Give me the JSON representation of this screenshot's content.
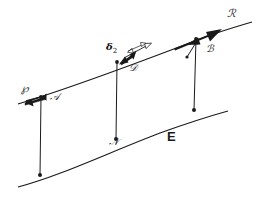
{
  "figure": {
    "background_color": "#ffffff",
    "stroke_color": "#1a1a1a",
    "width": 275,
    "height": 204
  },
  "labels": {
    "p_point": "℘",
    "a_vector": "𝒜",
    "delta": "δ",
    "delta_sub": "2",
    "d_point": "𝒟",
    "b_vector": "ℬ",
    "r_point": "ℛ",
    "n_point": "𝒩",
    "region": "E"
  },
  "label_positions": {
    "p_point": {
      "x": 21,
      "y": 89
    },
    "a_vector": {
      "x": 50,
      "y": 98
    },
    "delta": {
      "x": 107,
      "y": 47
    },
    "d_point": {
      "x": 130,
      "y": 68
    },
    "b_vector": {
      "x": 207,
      "y": 48
    },
    "r_point": {
      "x": 228,
      "y": 13
    },
    "n_point": {
      "x": 110,
      "y": 142
    },
    "region": {
      "x": 168,
      "y": 137
    }
  },
  "geometry": {
    "upper_curve": {
      "name": "upper-curve",
      "path": "M 18 104 C 70 88 140 62 200 39 C 215 33 235 27 252 22",
      "description": "Upper curve rising left to right with arrowhead near R"
    },
    "lower_curve": {
      "name": "lower-curve",
      "path": "M 18 187 C 60 176 110 152 160 133 C 185 124 210 116 228 111",
      "description": "Lower curve rising left to right"
    },
    "transversals": [
      {
        "name": "transversal-p",
        "x1": 41,
        "y1": 97,
        "x2": 40,
        "y2": 175
      },
      {
        "name": "transversal-d",
        "x1": 117,
        "y1": 62,
        "x2": 116,
        "y2": 139
      },
      {
        "name": "transversal-b",
        "x1": 196,
        "y1": 39,
        "x2": 194,
        "y2": 110
      }
    ],
    "nodes": [
      {
        "name": "node-p-upper",
        "x": 41,
        "y": 97
      },
      {
        "name": "node-p-lower",
        "x": 40,
        "y": 175
      },
      {
        "name": "node-d-upper",
        "x": 117,
        "y": 62
      },
      {
        "name": "node-n-lower",
        "x": 116,
        "y": 139
      },
      {
        "name": "node-b-upper",
        "x": 196,
        "y": 39
      },
      {
        "name": "node-b-lower",
        "x": 194,
        "y": 110
      }
    ],
    "vectors": [
      {
        "name": "vector-a",
        "x1": 28,
        "y1": 102,
        "x2": 48,
        "y2": 97,
        "description": "Tangent vector A at point P, thick arrow pointing right"
      },
      {
        "name": "vector-delta-2",
        "x1": 124,
        "y1": 60,
        "x2": 143,
        "y2": 49,
        "description": "Thick arrow delta-2 at point D"
      },
      {
        "name": "vector-d-secondary",
        "x1": 128,
        "y1": 57,
        "x2": 151,
        "y2": 45,
        "description": "Outline arrow at point D"
      },
      {
        "name": "vector-d-tertiary",
        "x1": 131,
        "y1": 51,
        "x2": 145,
        "y2": 44,
        "description": "Thin arrow at point D"
      },
      {
        "name": "vector-b",
        "x1": 188,
        "y1": 55,
        "x2": 199,
        "y2": 40,
        "description": "Vector B along transversal upward"
      },
      {
        "name": "vector-r",
        "x1": 175,
        "y1": 48,
        "x2": 218,
        "y2": 31,
        "description": "Large arrowhead on upper curve toward R"
      }
    ]
  }
}
